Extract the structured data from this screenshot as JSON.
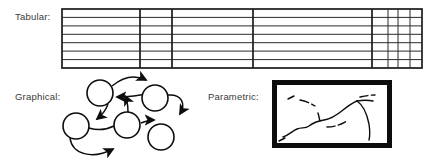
{
  "figure": {
    "background_color": "#ffffff",
    "line_color": "#1a1a1a",
    "text_color": "#3a3a3a"
  },
  "panels": {
    "tabular": {
      "label": "Tabular:",
      "icon_name": "table-grid",
      "box": {
        "x": 62,
        "y": 9,
        "width": 360,
        "height": 59
      },
      "row_count": 7,
      "row_line_y": [
        9,
        17.4,
        25.9,
        34.3,
        42.7,
        51.1,
        59.6,
        68
      ],
      "column_line_x": [
        62,
        140,
        172,
        253,
        372,
        388,
        398,
        410,
        422
      ],
      "thick_column_line_x": [
        62,
        140,
        172,
        253,
        372,
        422
      ],
      "thin_column_line_x": [
        388,
        398,
        410
      ],
      "border_width_px": 1.6,
      "inner_line_width_px": 0.9
    },
    "graphical": {
      "label": "Graphical:",
      "icon_name": "directed-graph",
      "node_radius": 13,
      "nodes": [
        {
          "id": "n1",
          "cx": 100,
          "cy": 93
        },
        {
          "id": "n2",
          "cx": 155,
          "cy": 98
        },
        {
          "id": "n3",
          "cx": 76,
          "cy": 126
        },
        {
          "id": "n4",
          "cx": 127,
          "cy": 125
        },
        {
          "id": "n5",
          "cx": 161,
          "cy": 137
        }
      ],
      "edge_count": 6,
      "edges": [
        {
          "from": "n1",
          "to": "n2",
          "style": "arc-over-top"
        },
        {
          "from": "n2",
          "to": "n1",
          "style": "arc-return"
        },
        {
          "from": "n1",
          "to": "n4",
          "style": "arc-down-left"
        },
        {
          "from": "n4",
          "to": "n1",
          "style": "arc-up"
        },
        {
          "from": "n2",
          "to": "n5",
          "style": "arc-right-loop"
        },
        {
          "from": "n4",
          "to": "n5",
          "style": "arc-right"
        },
        {
          "from": "n3",
          "to": "n4",
          "style": "arc-bottom"
        }
      ],
      "stroke_width_px": 1.5
    },
    "parametric": {
      "label": "Parametric:",
      "icon_name": "contour-map-frame",
      "frame": {
        "x": 272,
        "y": 80,
        "width": 120,
        "height": 68
      },
      "frame_border_width_px": 5,
      "fill_color": "#ffffff",
      "curve_count": 6,
      "curves": [
        {
          "id": "c1",
          "kind": "solid-ridge"
        },
        {
          "id": "c2",
          "kind": "dashed-upper"
        },
        {
          "id": "c3",
          "kind": "dashed-mid"
        },
        {
          "id": "c4",
          "kind": "short-tick"
        },
        {
          "id": "c5",
          "kind": "dashed-right"
        },
        {
          "id": "c6",
          "kind": "descending-tail"
        }
      ],
      "stroke_width_px": 1.4
    }
  }
}
